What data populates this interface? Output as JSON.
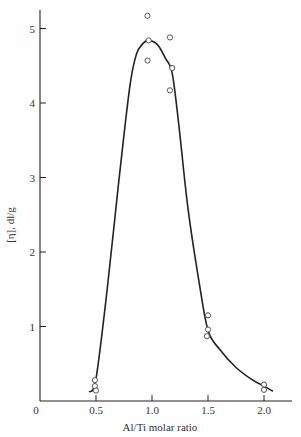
{
  "chart_data": {
    "type": "scatter",
    "title": "",
    "xlabel": "Al/Ti molar ratio",
    "ylabel": "[η], dl/g",
    "xlim": [
      0,
      2.2
    ],
    "ylim": [
      0,
      5.3
    ],
    "grid": false,
    "legend": null,
    "x_ticks": [
      0.5,
      1.0,
      1.5,
      2.0
    ],
    "x_tick_labels": [
      "0.5",
      "1.0",
      "1.5",
      "2.0"
    ],
    "origin_label": "0",
    "y_ticks": [
      1,
      2,
      3,
      4,
      5
    ],
    "y_tick_labels": [
      "1",
      "2",
      "3",
      "4",
      "5"
    ],
    "series": [
      {
        "name": "measured",
        "marker": "open-circle",
        "points": [
          {
            "x": 0.49,
            "y": 0.28
          },
          {
            "x": 0.49,
            "y": 0.2
          },
          {
            "x": 0.5,
            "y": 0.14
          },
          {
            "x": 0.96,
            "y": 5.17
          },
          {
            "x": 0.97,
            "y": 4.84
          },
          {
            "x": 0.96,
            "y": 4.57
          },
          {
            "x": 1.16,
            "y": 4.88
          },
          {
            "x": 1.18,
            "y": 4.47
          },
          {
            "x": 1.16,
            "y": 4.17
          },
          {
            "x": 1.5,
            "y": 1.15
          },
          {
            "x": 1.5,
            "y": 0.96
          },
          {
            "x": 1.49,
            "y": 0.87
          },
          {
            "x": 2.0,
            "y": 0.22
          },
          {
            "x": 2.0,
            "y": 0.15
          }
        ]
      },
      {
        "name": "fitted curve",
        "type": "line",
        "points": [
          {
            "x": 0.44,
            "y": 0.12
          },
          {
            "x": 0.5,
            "y": 0.3
          },
          {
            "x": 0.6,
            "y": 1.5
          },
          {
            "x": 0.7,
            "y": 2.9
          },
          {
            "x": 0.8,
            "y": 4.2
          },
          {
            "x": 0.86,
            "y": 4.65
          },
          {
            "x": 0.92,
            "y": 4.8
          },
          {
            "x": 0.97,
            "y": 4.84
          },
          {
            "x": 1.05,
            "y": 4.78
          },
          {
            "x": 1.12,
            "y": 4.6
          },
          {
            "x": 1.18,
            "y": 4.4
          },
          {
            "x": 1.24,
            "y": 3.7
          },
          {
            "x": 1.32,
            "y": 2.6
          },
          {
            "x": 1.42,
            "y": 1.6
          },
          {
            "x": 1.5,
            "y": 0.95
          },
          {
            "x": 1.6,
            "y": 0.7
          },
          {
            "x": 1.75,
            "y": 0.45
          },
          {
            "x": 1.9,
            "y": 0.28
          },
          {
            "x": 2.0,
            "y": 0.2
          },
          {
            "x": 2.08,
            "y": 0.13
          }
        ]
      }
    ]
  },
  "colors": {
    "ink": "#222222",
    "marker_stroke": "#555555",
    "background": "#ffffff"
  }
}
